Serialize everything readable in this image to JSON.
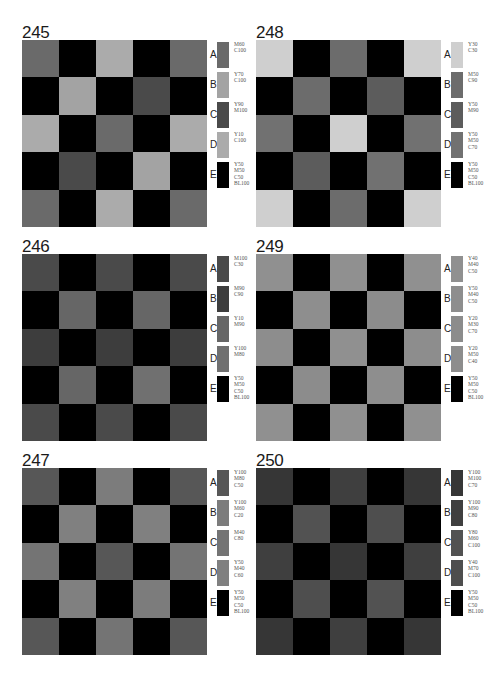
{
  "panels": [
    {
      "id": "245",
      "title": "245",
      "position": {
        "left": 22,
        "top": 24
      },
      "swatches": [
        {
          "letter": "A",
          "code": "M60\nC100",
          "color": "#6a6a6a"
        },
        {
          "letter": "B",
          "code": "Y70\nC100",
          "color": "#a3a3a3"
        },
        {
          "letter": "C",
          "code": "Y90\nM100",
          "color": "#4a4a4a"
        },
        {
          "letter": "D",
          "code": "Y10\nC100",
          "color": "#ababab"
        },
        {
          "letter": "E",
          "code": "Y50\nM50\nC50\nBL100",
          "color": "#000000"
        }
      ],
      "grid": [
        [
          "A",
          "E",
          "D",
          "E",
          "A"
        ],
        [
          "E",
          "B",
          "E",
          "C",
          "E"
        ],
        [
          "D",
          "E",
          "A",
          "E",
          "D"
        ],
        [
          "E",
          "C",
          "E",
          "B",
          "E"
        ],
        [
          "A",
          "E",
          "D",
          "E",
          "A"
        ]
      ]
    },
    {
      "id": "248",
      "title": "248",
      "position": {
        "left": 256,
        "top": 24
      },
      "swatches": [
        {
          "letter": "A",
          "code": "Y30\nC30",
          "color": "#cfcfcf"
        },
        {
          "letter": "B",
          "code": "M50\nC90",
          "color": "#6c6c6c"
        },
        {
          "letter": "C",
          "code": "Y50\nM90",
          "color": "#5c5c5c"
        },
        {
          "letter": "D",
          "code": "Y50\nM50\nC70",
          "color": "#717171"
        },
        {
          "letter": "E",
          "code": "Y50\nM50\nC50\nBL100",
          "color": "#000000"
        }
      ],
      "grid": [
        [
          "A",
          "E",
          "B",
          "E",
          "A"
        ],
        [
          "E",
          "B",
          "E",
          "C",
          "E"
        ],
        [
          "D",
          "E",
          "A",
          "E",
          "D"
        ],
        [
          "E",
          "C",
          "E",
          "D",
          "E"
        ],
        [
          "A",
          "E",
          "B",
          "E",
          "A"
        ]
      ]
    },
    {
      "id": "246",
      "title": "246",
      "position": {
        "left": 22,
        "top": 238
      },
      "swatches": [
        {
          "letter": "A",
          "code": "M100\nC30",
          "color": "#4a4a4a"
        },
        {
          "letter": "B",
          "code": "M90\nC90",
          "color": "#3d3d3d"
        },
        {
          "letter": "C",
          "code": "Y10\nM90",
          "color": "#666666"
        },
        {
          "letter": "D",
          "code": "Y100\nM80",
          "color": "#707070"
        },
        {
          "letter": "E",
          "code": "Y50\nM50\nC50\nBL100",
          "color": "#000000"
        }
      ],
      "grid": [
        [
          "A",
          "E",
          "A",
          "E",
          "A"
        ],
        [
          "E",
          "C",
          "E",
          "C",
          "E"
        ],
        [
          "B",
          "E",
          "B",
          "E",
          "B"
        ],
        [
          "E",
          "C",
          "E",
          "D",
          "E"
        ],
        [
          "A",
          "E",
          "A",
          "E",
          "A"
        ]
      ]
    },
    {
      "id": "249",
      "title": "249",
      "position": {
        "left": 256,
        "top": 238
      },
      "swatches": [
        {
          "letter": "A",
          "code": "Y40\nM40\nC50",
          "color": "#909090"
        },
        {
          "letter": "B",
          "code": "Y50\nM40\nC50",
          "color": "#8e8e8e"
        },
        {
          "letter": "C",
          "code": "Y20\nM30\nC70",
          "color": "#8c8c8c"
        },
        {
          "letter": "D",
          "code": "Y20\nM50\nC40",
          "color": "#8d8d8d"
        },
        {
          "letter": "E",
          "code": "Y50\nM50\nC50\nBL100",
          "color": "#000000"
        }
      ],
      "grid": [
        [
          "A",
          "E",
          "A",
          "E",
          "A"
        ],
        [
          "E",
          "B",
          "E",
          "C",
          "E"
        ],
        [
          "D",
          "E",
          "A",
          "E",
          "D"
        ],
        [
          "E",
          "C",
          "E",
          "B",
          "E"
        ],
        [
          "A",
          "E",
          "A",
          "E",
          "A"
        ]
      ]
    },
    {
      "id": "247",
      "title": "247",
      "position": {
        "left": 22,
        "top": 452
      },
      "swatches": [
        {
          "letter": "A",
          "code": "Y100\nM80\nC50",
          "color": "#575757"
        },
        {
          "letter": "B",
          "code": "Y100\nM60\nC20",
          "color": "#7c7c7c"
        },
        {
          "letter": "C",
          "code": "M40\nC80",
          "color": "#747474"
        },
        {
          "letter": "D",
          "code": "Y50\nM40\nC60",
          "color": "#808080"
        },
        {
          "letter": "E",
          "code": "Y50\nM50\nC50\nBL100",
          "color": "#000000"
        }
      ],
      "grid": [
        [
          "A",
          "E",
          "B",
          "E",
          "A"
        ],
        [
          "E",
          "D",
          "E",
          "D",
          "E"
        ],
        [
          "C",
          "E",
          "A",
          "E",
          "C"
        ],
        [
          "E",
          "D",
          "E",
          "B",
          "E"
        ],
        [
          "A",
          "E",
          "C",
          "E",
          "A"
        ]
      ]
    },
    {
      "id": "250",
      "title": "250",
      "position": {
        "left": 256,
        "top": 452
      },
      "swatches": [
        {
          "letter": "A",
          "code": "Y100\nM100\nC70",
          "color": "#363636"
        },
        {
          "letter": "B",
          "code": "Y100\nM90\nC80",
          "color": "#3f3f3f"
        },
        {
          "letter": "C",
          "code": "Y80\nM60\nC100",
          "color": "#525252"
        },
        {
          "letter": "D",
          "code": "Y40\nM70\nC100",
          "color": "#4e4e4e"
        },
        {
          "letter": "E",
          "code": "Y50\nM50\nC50\nBL100",
          "color": "#000000"
        }
      ],
      "grid": [
        [
          "A",
          "E",
          "B",
          "E",
          "A"
        ],
        [
          "E",
          "C",
          "E",
          "D",
          "E"
        ],
        [
          "B",
          "E",
          "A",
          "E",
          "B"
        ],
        [
          "E",
          "D",
          "E",
          "C",
          "E"
        ],
        [
          "A",
          "E",
          "B",
          "E",
          "A"
        ]
      ]
    }
  ]
}
